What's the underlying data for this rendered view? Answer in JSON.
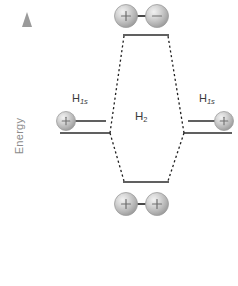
{
  "diagram": {
    "axis": {
      "label": "Energy",
      "direction": "up",
      "color": "#9a9a9a",
      "arrow_icon": "up-arrow-icon"
    },
    "labels": {
      "atomic_left": {
        "element": "H",
        "subscript": "1s"
      },
      "atomic_right": {
        "element": "H",
        "subscript": "1s"
      },
      "molecular": {
        "element": "H",
        "subscript": "2"
      }
    },
    "levels": [
      {
        "id": "antibonding",
        "name": "sigma-star-antibonding-level",
        "y": 35,
        "x1": 124,
        "x2": 168,
        "orbital_lobes": [
          {
            "sign": "+",
            "cx": 126,
            "cy": 16
          },
          {
            "sign": "−",
            "cx": 157,
            "cy": 16
          }
        ]
      },
      {
        "id": "bonding",
        "name": "sigma-bonding-level",
        "y": 182,
        "x1": 124,
        "x2": 168,
        "orbital_lobes": [
          {
            "sign": "+",
            "cx": 126,
            "cy": 204
          },
          {
            "sign": "+",
            "cx": 157,
            "cy": 204
          }
        ]
      },
      {
        "id": "atomic-left-upper",
        "name": "atomic-level-left-upper",
        "y": 121,
        "x1": 68,
        "x2": 106,
        "electron_lobe": {
          "sign": "+",
          "cx": 66,
          "cy": 121
        }
      },
      {
        "id": "atomic-left-lower",
        "name": "atomic-level-left-lower",
        "y": 133,
        "x1": 60,
        "x2": 110
      },
      {
        "id": "atomic-right-upper",
        "name": "atomic-level-right-upper",
        "y": 121,
        "x1": 188,
        "x2": 222,
        "electron_lobe": {
          "sign": "+",
          "cx": 224,
          "cy": 121
        }
      },
      {
        "id": "atomic-right-lower",
        "name": "atomic-level-right-lower",
        "y": 133,
        "x1": 184,
        "x2": 232
      }
    ],
    "connectors": [
      {
        "name": "connector-left-to-antibonding",
        "x1": 110,
        "y1": 133,
        "x2": 124,
        "y2": 35
      },
      {
        "name": "connector-left-to-bonding",
        "x1": 110,
        "y1": 133,
        "x2": 124,
        "y2": 182
      },
      {
        "name": "connector-right-to-antibonding",
        "x1": 184,
        "y1": 133,
        "x2": 168,
        "y2": 35
      },
      {
        "name": "connector-right-to-bonding",
        "x1": 184,
        "y1": 133,
        "x2": 168,
        "y2": 182
      }
    ],
    "colors": {
      "line": "#2b2b2b",
      "dotted": "#1f1f1f",
      "axis": "#a0a0a0",
      "sphere_light": "#e8e8e8",
      "sphere_mid": "#bdbdbd",
      "sphere_dark": "#8f8f8f",
      "sphere_edge": "#9d9d9d",
      "bond": "#4a4a4a",
      "text": "#3a3a3a",
      "axis_text": "#8b8b8b",
      "background": "#ffffff"
    }
  }
}
